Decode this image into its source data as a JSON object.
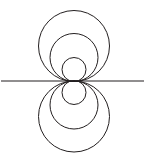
{
  "figure": {
    "background_color": "#ffffff",
    "stroke_color": "#231f20",
    "canvas": {
      "width": 145,
      "height": 162
    },
    "tangent_point": {
      "x": 74,
      "y": 81
    },
    "axis": {
      "name": "horizontal-tangent-line",
      "orientation": "horizontal",
      "y": 81,
      "x_start": 1,
      "x_end": 144,
      "stroke_width": 1.15
    },
    "circles": [
      {
        "id": "upper-small",
        "side": "upper",
        "cx": 74,
        "cy": 69.5,
        "r": 12.0,
        "stroke_width": 1.0
      },
      {
        "id": "upper-medium",
        "side": "upper",
        "cx": 74,
        "cy": 57.5,
        "r": 24.0,
        "stroke_width": 1.0
      },
      {
        "id": "upper-large",
        "side": "upper",
        "cx": 74,
        "cy": 46.0,
        "r": 35.5,
        "stroke_width": 1.0
      },
      {
        "id": "lower-small",
        "side": "lower",
        "cx": 74,
        "cy": 92.5,
        "r": 12.0,
        "stroke_width": 1.0
      },
      {
        "id": "lower-medium",
        "side": "lower",
        "cx": 74,
        "cy": 105.0,
        "r": 24.0,
        "stroke_width": 1.0
      },
      {
        "id": "lower-large",
        "side": "lower",
        "cx": 74,
        "cy": 116.5,
        "r": 35.5,
        "stroke_width": 1.0
      }
    ]
  },
  "chart_data": {
    "type": "scatter",
    "xlabel": "",
    "ylabel": "",
    "grid": false,
    "legend": "none",
    "xlim": [
      0,
      145
    ],
    "ylim": [
      162,
      0
    ],
    "annotations": [
      "Six circles mutually tangent at the single point (74, 81)",
      "Three circles lie above the horizontal line, three below",
      "The horizontal line is the common tangent at the shared point"
    ],
    "series": [
      {
        "name": "horizontal tangent line",
        "shape": "line",
        "x": [
          1,
          144
        ],
        "y": [
          81,
          81
        ]
      },
      {
        "name": "upper-small circle",
        "shape": "circle",
        "center": [
          74,
          69.5
        ],
        "radius": 12.0
      },
      {
        "name": "upper-medium circle",
        "shape": "circle",
        "center": [
          74,
          57.5
        ],
        "radius": 24.0
      },
      {
        "name": "upper-large circle",
        "shape": "circle",
        "center": [
          74,
          46.0
        ],
        "radius": 35.5
      },
      {
        "name": "lower-small circle",
        "shape": "circle",
        "center": [
          74,
          92.5
        ],
        "radius": 12.0
      },
      {
        "name": "lower-medium circle",
        "shape": "circle",
        "center": [
          74,
          105.0
        ],
        "radius": 24.0
      },
      {
        "name": "lower-large circle",
        "shape": "circle",
        "center": [
          74,
          116.5
        ],
        "radius": 35.5
      }
    ]
  }
}
